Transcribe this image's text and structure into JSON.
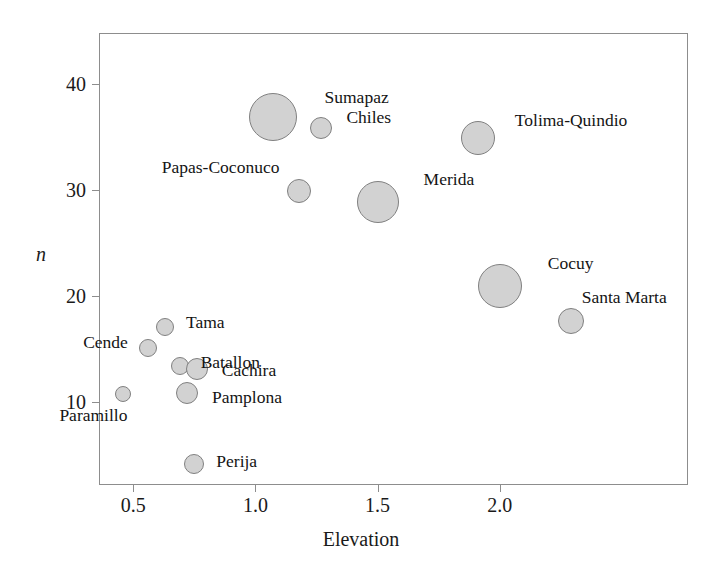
{
  "chart_data": {
    "type": "scatter",
    "title": "",
    "subtitle": "",
    "xlabel": "Elevation",
    "ylabel": "n",
    "xlim": [
      0.36,
      2.77
    ],
    "ylim": [
      2.2,
      44.8
    ],
    "xticks": [
      0.5,
      1.0,
      1.5,
      2.0
    ],
    "xticklabels": [
      "0.5",
      "1.0",
      "1.5",
      "2.0"
    ],
    "yticks": [
      10,
      20,
      30,
      40
    ],
    "yticklabels": [
      "10",
      "20",
      "30",
      "40"
    ],
    "grid": false,
    "legend": "none",
    "marker": "circle",
    "marker_fill": "#d2d2d2",
    "marker_edge": "#808080",
    "size_encoding": "bubble area proportional to sample weight",
    "points": [
      {
        "label": "Sumapaz",
        "x": 1.07,
        "y": 36.9,
        "size": 24,
        "label_pos": "right",
        "label_dx": 28,
        "label_dy": -20
      },
      {
        "label": "Chiles",
        "x": 1.27,
        "y": 35.8,
        "size": 11,
        "label_pos": "right",
        "label_dx": 14,
        "label_dy": -11
      },
      {
        "label": "Tolima-Quindio",
        "x": 1.91,
        "y": 34.9,
        "size": 17,
        "label_pos": "right",
        "label_dx": 20,
        "label_dy": -18
      },
      {
        "label": "Papas-Coconuco",
        "x": 1.18,
        "y": 29.9,
        "size": 12,
        "label_pos": "left",
        "label_dx": -8,
        "label_dy": -24
      },
      {
        "label": "Merida",
        "x": 1.5,
        "y": 28.9,
        "size": 21,
        "label_pos": "right",
        "label_dx": 25,
        "label_dy": -23
      },
      {
        "label": "Cocuy",
        "x": 2.0,
        "y": 21.0,
        "size": 22,
        "label_pos": "right",
        "label_dx": 26,
        "label_dy": -23
      },
      {
        "label": "Santa Marta",
        "x": 2.29,
        "y": 17.7,
        "size": 13,
        "label_pos": "right",
        "label_dx": -2,
        "label_dy": -24
      },
      {
        "label": "Tama",
        "x": 0.63,
        "y": 17.1,
        "size": 9,
        "label_pos": "right",
        "label_dx": 12,
        "label_dy": -5
      },
      {
        "label": "Cende",
        "x": 0.56,
        "y": 15.1,
        "size": 9,
        "label_pos": "left",
        "label_dx": -11,
        "label_dy": -6
      },
      {
        "label": "Batallon",
        "x": 0.69,
        "y": 13.4,
        "size": 9,
        "label_pos": "right",
        "label_dx": 12,
        "label_dy": -4
      },
      {
        "label": "Cachira",
        "x": 0.76,
        "y": 13.1,
        "size": 11,
        "label_pos": "right",
        "label_dx": 14,
        "label_dy": 1
      },
      {
        "label": "Pamplona",
        "x": 0.72,
        "y": 10.9,
        "size": 11,
        "label_pos": "right",
        "label_dx": 14,
        "label_dy": 4
      },
      {
        "label": "Paramillo",
        "x": 0.46,
        "y": 10.8,
        "size": 8,
        "label_pos": "left",
        "label_dx": 12,
        "label_dy": 21
      },
      {
        "label": "Perija",
        "x": 0.75,
        "y": 4.2,
        "size": 10,
        "label_pos": "right",
        "label_dx": 12,
        "label_dy": -3
      }
    ]
  },
  "axes": {
    "plot_left_px": 99,
    "plot_top_px": 33,
    "plot_width_px": 589,
    "plot_height_px": 452
  }
}
